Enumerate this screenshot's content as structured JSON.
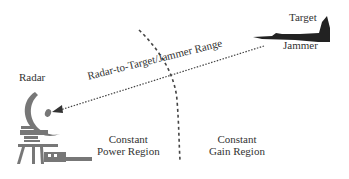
{
  "diagram": {
    "labels": {
      "radar": "Radar",
      "target": "Target",
      "jammer": "Jammer",
      "range": "Radar-to-Target/Jammer Range",
      "power_region": [
        "Constant",
        "Power Region"
      ],
      "gain_region": [
        "Constant",
        "Gain Region"
      ]
    },
    "elements": {
      "radar_icon": "radar-dish-icon",
      "aircraft_icon": "jet-aircraft-icon",
      "range_arrow": "dotted-arrow from jammer to radar",
      "boundary": "dashed curved boundary separating regions"
    },
    "colors": {
      "text": "#333333",
      "icon_gray": "#777777",
      "aircraft": "#222222",
      "lines": "#444444",
      "background": "#ffffff"
    }
  }
}
